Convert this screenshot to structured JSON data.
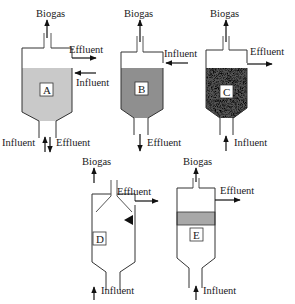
{
  "figure": {
    "colors": {
      "liquid_light": "#c9c9c9",
      "liquid_dark": "#8f8f8f",
      "sludge_dark": "#1c1c1c",
      "outline": "#333333",
      "background": "#ffffff"
    }
  },
  "reactors": [
    {
      "id": "A",
      "tag": "A",
      "fill": "uniform light gray (completely mixed)",
      "labels": {
        "top": "Biogas",
        "side_out": "Effluent",
        "side_in": "Influent",
        "bottom_in": "Influent",
        "bottom_out": "Effluent"
      }
    },
    {
      "id": "B",
      "tag": "B",
      "fill": "uniform darker gray",
      "labels": {
        "top": "Biogas",
        "side_in": "Influent",
        "bottom_out": "Effluent"
      }
    },
    {
      "id": "C",
      "tag": "C",
      "fill": "dense speckled sludge bed (full)",
      "labels": {
        "top": "Biogas",
        "side_out": "Effluent",
        "bottom_in": "Influent"
      }
    },
    {
      "id": "D",
      "tag": "D",
      "fill": "sludge blanket with gas-solids separator hood",
      "labels": {
        "top": "Biogas",
        "side_out": "Effluent",
        "bottom_in": "Influent"
      }
    },
    {
      "id": "E",
      "tag": "E",
      "fill": "sludge bed below packed/filter layer",
      "labels": {
        "top": "Biogas",
        "side_out": "Effluent",
        "bottom_in": "Influent"
      }
    }
  ]
}
